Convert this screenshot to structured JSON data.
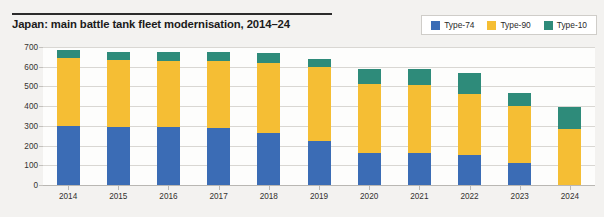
{
  "header": {
    "title": "Japan: main battle tank fleet modernisation, 2014–24"
  },
  "legend": {
    "position": "top-right",
    "entries": [
      {
        "label": "Type-74",
        "color": "#3b6cb5"
      },
      {
        "label": "Type-90",
        "color": "#f5be34"
      },
      {
        "label": "Type-10",
        "color": "#2e8b7a"
      }
    ]
  },
  "chart_data": {
    "type": "bar",
    "subtype": "stacked-vertical",
    "title": "Japan: main battle tank fleet modernisation, 2014–24",
    "xlabel": "",
    "ylabel": "",
    "ylim": [
      0,
      700
    ],
    "ytick_step": 100,
    "ytick_labels": [
      "0",
      "100",
      "200",
      "300",
      "400",
      "500",
      "600",
      "700"
    ],
    "grid": true,
    "legend_position": "top-right",
    "categories": [
      "2014",
      "2015",
      "2016",
      "2017",
      "2018",
      "2019",
      "2020",
      "2021",
      "2022",
      "2023",
      "2024"
    ],
    "series": [
      {
        "name": "Type-74",
        "color": "#3b6cb5",
        "values": [
          300,
          295,
          295,
          290,
          265,
          225,
          160,
          160,
          150,
          110,
          0
        ]
      },
      {
        "name": "Type-90",
        "color": "#f5be34",
        "values": [
          345,
          340,
          335,
          340,
          355,
          375,
          350,
          345,
          310,
          290,
          285
        ]
      },
      {
        "name": "Type-10",
        "color": "#2e8b7a",
        "values": [
          40,
          40,
          45,
          45,
          50,
          40,
          80,
          85,
          110,
          65,
          110
        ]
      }
    ],
    "totals": [
      685,
      675,
      675,
      675,
      670,
      640,
      590,
      590,
      570,
      465,
      395
    ]
  }
}
